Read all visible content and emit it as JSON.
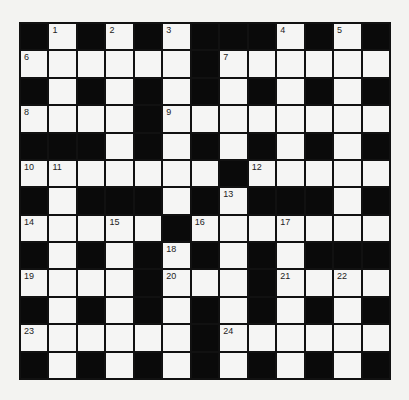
{
  "puzzle": {
    "rows": 13,
    "cols": 13,
    "colors": {
      "block": "#0a0a0a",
      "cell": "#f5f5f4",
      "border": "#111111",
      "background": "#f3f3f1"
    },
    "layout": [
      "#.#.#.###.#.#",
      "......#......",
      "#.#.#.#.#.#.#",
      "....#........",
      "###.#.#.#.#.#",
      ".......#.....",
      "#.###.#.###.#",
      ".....#.......",
      "#.#.#.#.#.###",
      "....#...#....",
      "#.#.#.#.#.#.#",
      "......#......",
      "#.#.#.#.#.#.#"
    ],
    "numbers": [
      {
        "r": 0,
        "c": 1,
        "n": "1"
      },
      {
        "r": 0,
        "c": 3,
        "n": "2"
      },
      {
        "r": 0,
        "c": 5,
        "n": "3"
      },
      {
        "r": 0,
        "c": 9,
        "n": "4"
      },
      {
        "r": 0,
        "c": 11,
        "n": "5"
      },
      {
        "r": 1,
        "c": 0,
        "n": "6"
      },
      {
        "r": 1,
        "c": 7,
        "n": "7"
      },
      {
        "r": 3,
        "c": 0,
        "n": "8"
      },
      {
        "r": 3,
        "c": 5,
        "n": "9"
      },
      {
        "r": 5,
        "c": 0,
        "n": "10"
      },
      {
        "r": 5,
        "c": 1,
        "n": "11"
      },
      {
        "r": 5,
        "c": 8,
        "n": "12"
      },
      {
        "r": 6,
        "c": 7,
        "n": "13"
      },
      {
        "r": 7,
        "c": 0,
        "n": "14"
      },
      {
        "r": 7,
        "c": 3,
        "n": "15"
      },
      {
        "r": 7,
        "c": 6,
        "n": "16"
      },
      {
        "r": 7,
        "c": 9,
        "n": "17"
      },
      {
        "r": 8,
        "c": 5,
        "n": "18"
      },
      {
        "r": 9,
        "c": 0,
        "n": "19"
      },
      {
        "r": 9,
        "c": 5,
        "n": "20"
      },
      {
        "r": 9,
        "c": 9,
        "n": "21"
      },
      {
        "r": 9,
        "c": 11,
        "n": "22"
      },
      {
        "r": 11,
        "c": 0,
        "n": "23"
      },
      {
        "r": 11,
        "c": 7,
        "n": "24"
      }
    ],
    "entries": {}
  }
}
